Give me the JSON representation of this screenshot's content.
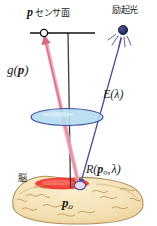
{
  "figure": {
    "width": 157,
    "height": 226,
    "background": "#ffffff",
    "caption_language": "ja"
  },
  "labels": {
    "sensor_point": "p",
    "sensor_plane": "センサ面",
    "excitation_light": "励起光",
    "emission_function": "g(p)",
    "emission_function_base": "g",
    "emission_function_arg": "p",
    "excitation_spectrum": "E(λ)",
    "excitation_spectrum_base": "E",
    "excitation_spectrum_arg": "λ",
    "reflectance_base": "R",
    "reflectance_arg_point": "p",
    "reflectance_arg_point_sub": "o",
    "reflectance_arg_lambda": "λ",
    "reflectance_full": "R(p_o, λ)",
    "brain": "脳",
    "object_point": "p",
    "object_point_sub": "o",
    "object_point_full": "p_o"
  },
  "elements": {
    "sensor_plane_line": {
      "name": "sensor-plane-line",
      "x1": 30,
      "y1": 33,
      "x2": 95,
      "y2": 33,
      "color": "#111111",
      "stroke_width": 1.6
    },
    "sensor_point_marker": {
      "name": "sensor-point-marker",
      "cx": 44,
      "cy": 33,
      "r": 3.6,
      "fill": "#ffffff",
      "stroke": "#111111"
    },
    "optical_axis": {
      "name": "optical-axis-line",
      "x1": 68,
      "y1": 33,
      "x2": 70,
      "y2": 188,
      "color": "#3b3b46",
      "stroke_width": 1.3
    },
    "light_source": {
      "name": "excitation-light-source",
      "cx": 123,
      "cy": 30,
      "r": 4.4,
      "fill": "#26306b",
      "stroke": "#1a1f4a",
      "ray_count": 5
    },
    "lens": {
      "name": "lens-ellipse",
      "cx": 67,
      "cy": 117,
      "rx": 36,
      "ry": 8.5,
      "fill": "#b5dcef",
      "stroke": "#3a4fa0",
      "stroke_width": 1.2
    },
    "emission_ray": {
      "name": "emission-ray",
      "x1": 79,
      "y1": 186,
      "x2": 44,
      "y2": 36,
      "color": "#e8899a",
      "stroke_width": 2.6,
      "arrow": "up"
    },
    "excitation_ray": {
      "name": "excitation-ray",
      "x1": 122,
      "y1": 38,
      "x2": 80,
      "y2": 186,
      "color": "#4a4e96",
      "stroke_width": 1.3,
      "arrow": "down"
    },
    "brain_body": {
      "name": "brain-shape",
      "fill": "#f5e2b8",
      "stroke": "#b89a63",
      "cx": 78,
      "cy": 205,
      "rx": 66,
      "ry": 22
    },
    "activation_patch": {
      "name": "activation-region",
      "fill": "#ef3b34",
      "cx": 62,
      "cy": 184,
      "rx": 27,
      "ry": 6
    },
    "object_point_marker": {
      "name": "object-point-marker",
      "cx": 80,
      "cy": 186,
      "rx": 5.5,
      "ry": 4,
      "fill": "#e8d9f2",
      "stroke": "#4a4e96"
    }
  },
  "colors": {
    "emission_pink": "#e8899a",
    "excitation_blue": "#4a4e96",
    "lens_fill": "#b5dcef",
    "lens_stroke": "#3a4fa0",
    "brain_fill": "#f5e2b8",
    "brain_stroke": "#b89a63",
    "activation_red": "#ef3b34",
    "source_navy": "#26306b",
    "text": "#1a1a1a"
  }
}
